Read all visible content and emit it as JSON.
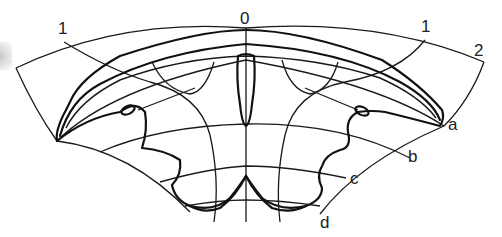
{
  "figure": {
    "labels": {
      "top_left_1": "1",
      "top_left_2": "2",
      "top_center_0": "0",
      "top_right_1": "1",
      "top_right_2": "2",
      "side_a": "a",
      "side_b": "b",
      "side_c": "c",
      "side_d": "d"
    },
    "meridian_labels": [
      "2",
      "1",
      "0",
      "1",
      "2"
    ],
    "parallel_labels": [
      "a",
      "b",
      "c",
      "d"
    ],
    "colors": {
      "line": "#1a1a1a",
      "background": "#ffffff"
    }
  }
}
